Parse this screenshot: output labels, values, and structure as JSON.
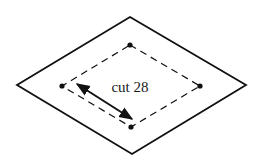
{
  "diagram": {
    "label": "cut 28",
    "colors": {
      "stroke": "#111111",
      "text": "#1a1a1a",
      "background": "#ffffff"
    },
    "outer_diamond": {
      "top": [
        130,
        17
      ],
      "right": [
        246,
        85
      ],
      "bottom": [
        132,
        154
      ],
      "left": [
        17,
        85
      ]
    },
    "inner_dashed_diamond": {
      "top": [
        130,
        45
      ],
      "right": [
        200,
        86
      ],
      "bottom": [
        131,
        127
      ],
      "left": [
        62,
        86
      ]
    },
    "double_arrow": {
      "start": [
        77,
        84
      ],
      "end": [
        132,
        119
      ]
    }
  }
}
